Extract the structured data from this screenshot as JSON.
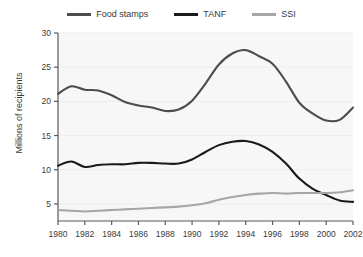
{
  "legend": {
    "position": "top-center",
    "items": [
      {
        "label": "Food stamps",
        "color": "#4d4d4d",
        "icon": "line-swatch-icon"
      },
      {
        "label": "TANF",
        "color": "#1a1a1a",
        "icon": "line-swatch-icon"
      },
      {
        "label": "SSI",
        "color": "#a6a6a6",
        "icon": "line-swatch-icon"
      }
    ]
  },
  "axes": {
    "ylabel": "Millions of recipients",
    "xlabel": "",
    "yticks": [
      "5",
      "10",
      "15",
      "20",
      "25",
      "30"
    ],
    "xticks": [
      "1980",
      "1982",
      "1984",
      "1986",
      "1988",
      "1990",
      "1992",
      "1994",
      "1996",
      "1998",
      "2000",
      "2002"
    ]
  },
  "colors": {
    "plot_background": "#f7f7f7",
    "axis": "#595959",
    "gridline": "#ededed",
    "text": "#3a3a3a",
    "food_stamps": "#4d4d4d",
    "tanf": "#1a1a1a",
    "ssi": "#a6a6a6"
  },
  "chart_data": {
    "type": "line",
    "title": "",
    "xlabel": "",
    "ylabel": "Millions of recipients",
    "xlim": [
      1980,
      2002
    ],
    "ylim": [
      2.5,
      30
    ],
    "grid": true,
    "legend_position": "top-center",
    "x": [
      1980,
      1981,
      1982,
      1983,
      1984,
      1985,
      1986,
      1987,
      1988,
      1989,
      1990,
      1991,
      1992,
      1993,
      1994,
      1995,
      1996,
      1997,
      1998,
      1999,
      2000,
      2001,
      2002
    ],
    "series": [
      {
        "name": "Food stamps",
        "color": "#4d4d4d",
        "values": [
          21.1,
          22.2,
          21.7,
          21.6,
          20.9,
          19.9,
          19.4,
          19.1,
          18.6,
          18.8,
          20.1,
          22.6,
          25.4,
          27.0,
          27.5,
          26.6,
          25.5,
          22.9,
          19.8,
          18.2,
          17.2,
          17.3,
          19.1
        ]
      },
      {
        "name": "TANF",
        "color": "#1a1a1a",
        "values": [
          10.6,
          11.2,
          10.4,
          10.7,
          10.8,
          10.8,
          11.0,
          11.0,
          10.9,
          10.9,
          11.5,
          12.6,
          13.6,
          14.1,
          14.2,
          13.7,
          12.6,
          10.9,
          8.7,
          7.2,
          6.3,
          5.5,
          5.3
        ]
      },
      {
        "name": "SSI",
        "color": "#a6a6a6",
        "values": [
          4.1,
          4.0,
          3.9,
          4.0,
          4.1,
          4.2,
          4.3,
          4.4,
          4.5,
          4.6,
          4.8,
          5.1,
          5.6,
          6.0,
          6.3,
          6.5,
          6.6,
          6.5,
          6.6,
          6.6,
          6.6,
          6.7,
          7.0
        ]
      }
    ]
  }
}
